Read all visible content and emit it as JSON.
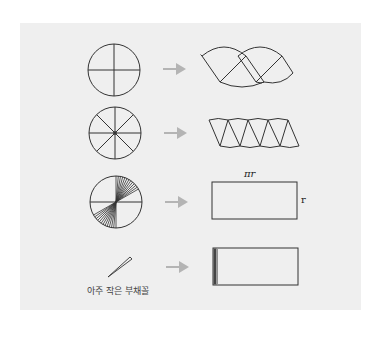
{
  "figure": {
    "colors": {
      "background": "#ffffff",
      "panel": "#efefef",
      "stroke": "#333333",
      "arrow": "#b4b4b4"
    },
    "rows": [
      {
        "id": "row-1",
        "sectors": 4,
        "result": "wavy shape of 4 sectors"
      },
      {
        "id": "row-2",
        "sectors": 8,
        "result": "wavy shape of 8 sectors"
      },
      {
        "id": "row-3",
        "sectors": "many",
        "result": "rectangle"
      },
      {
        "id": "row-4",
        "sectors": "very small sector",
        "result": "rectangle filled with tiny sectors"
      }
    ],
    "labels": {
      "width_label": "πr",
      "height_label": "r",
      "small_sector_caption": "아주 작은 부채꼴"
    }
  }
}
